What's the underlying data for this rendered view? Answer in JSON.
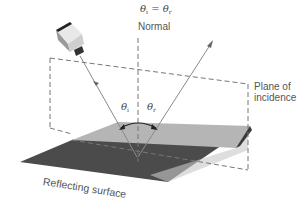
{
  "title_equation": {
    "lhs": "θ",
    "lhs_sub": "i",
    "eq": "=",
    "rhs": "θ",
    "rhs_sub": "r"
  },
  "labels": {
    "normal": "Normal",
    "plane_line1": "Plane of",
    "plane_line2": "incidence",
    "surface": "Reflecting surface",
    "theta_i": "θ",
    "theta_i_sub": "i",
    "theta_r": "θ",
    "theta_r_sub": "r"
  },
  "icons": {
    "light_source": "light-source-icon"
  },
  "colors": {
    "surface_dark": "#4a4a4a",
    "surface_light": "#b3b3b3",
    "surface_edge": "#d6d6d6",
    "ray": "#8a8a8a",
    "dashed": "#777777",
    "arrow": "#222222"
  }
}
